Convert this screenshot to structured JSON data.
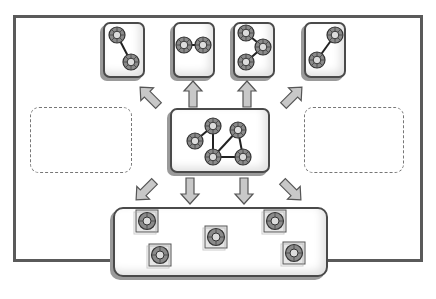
{
  "diagram": {
    "title": "",
    "caption": "",
    "colors": {
      "frame": "#5a5a5a",
      "card_border": "#4a4a4a",
      "node_fill": "#8a8a8a",
      "node_center": "#d8d8d8",
      "arrow_fill": "#c8c8c8",
      "arrow_stroke": "#555555",
      "dashed": "#777777"
    },
    "central_graph": {
      "label": "full graph",
      "nodes": 5,
      "edges": 5
    },
    "subgraphs": [
      {
        "label": "subgraph-1",
        "nodes": 2,
        "layout": "diagonal-down"
      },
      {
        "label": "subgraph-2",
        "nodes": 2,
        "layout": "horizontal"
      },
      {
        "label": "subgraph-3",
        "nodes": 3,
        "layout": "path"
      },
      {
        "label": "subgraph-4",
        "nodes": 2,
        "layout": "diagonal-up"
      }
    ],
    "placeholders": [
      {
        "label": "empty-left"
      },
      {
        "label": "empty-right"
      }
    ],
    "node_pool": {
      "label": "isolated nodes",
      "count": 5
    },
    "arrows": {
      "up": 4,
      "down": 4
    }
  }
}
